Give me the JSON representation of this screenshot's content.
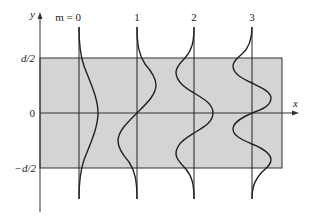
{
  "diagram": {
    "type": "waveguide-mode-profiles",
    "axes": {
      "x_label": "x",
      "y_label": "y"
    },
    "y_ticks": [
      {
        "label": "d/2",
        "y": 58
      },
      {
        "label": "0",
        "y": 113
      },
      {
        "label": "−d/2",
        "y": 168
      }
    ],
    "region": {
      "fill": "#d4d4d4",
      "stroke": "#333333",
      "x0": 40,
      "x1": 282,
      "y0": 58,
      "y1": 168
    },
    "modes": [
      {
        "label": "m = 0",
        "x": 79
      },
      {
        "label": "1",
        "x": 137
      },
      {
        "label": "2",
        "x": 194
      },
      {
        "label": "3",
        "x": 252
      }
    ]
  }
}
